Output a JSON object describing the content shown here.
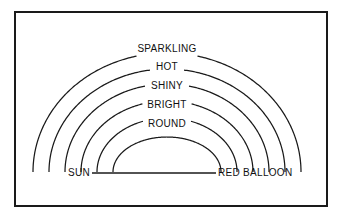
{
  "figure": {
    "kind": "semantic-arc-diagram",
    "width": 341,
    "height": 222,
    "background_color": "#ffffff",
    "ink_color": "#1a1a1a"
  },
  "frame": {
    "name": "figure-border",
    "x": 15,
    "y": 12,
    "width": 312,
    "height": 194,
    "stroke_color": "#1a1a1a",
    "stroke_width": 2
  },
  "nodes": {
    "left": {
      "label": "SUN",
      "x": 90,
      "y": 176
    },
    "right": {
      "label": "RED BALLOON",
      "x": 218,
      "y": 176
    }
  },
  "baseline": {
    "name": "sun-to-red-balloon-connector",
    "x1": 92,
    "x2": 216,
    "y": 173
  },
  "arcs": [
    {
      "label": "SPARKLING",
      "index": 0,
      "rx": 134,
      "ry": 119,
      "cx": 167,
      "cy": 172,
      "label_x": 167,
      "label_y": 52,
      "gap_half_width": 33
    },
    {
      "label": "HOT",
      "index": 1,
      "rx": 118,
      "ry": 103,
      "cx": 167,
      "cy": 172,
      "label_x": 167,
      "label_y": 70,
      "gap_half_width": 16
    },
    {
      "label": "SHINY",
      "index": 2,
      "rx": 102,
      "ry": 88,
      "cx": 167,
      "cy": 172,
      "label_x": 167,
      "label_y": 89,
      "gap_half_width": 21
    },
    {
      "label": "BRIGHT",
      "index": 3,
      "rx": 86,
      "ry": 71,
      "cx": 167,
      "cy": 172,
      "label_x": 167,
      "label_y": 108,
      "gap_half_width": 24
    },
    {
      "label": "ROUND",
      "index": 4,
      "rx": 70,
      "ry": 54,
      "cx": 167,
      "cy": 172,
      "label_x": 167,
      "label_y": 127,
      "gap_half_width": 24
    },
    {
      "label": "",
      "index": 5,
      "rx": 54,
      "ry": 35,
      "cx": 167,
      "cy": 172,
      "label_x": 167,
      "label_y": 0,
      "gap_half_width": 0
    }
  ],
  "chart_data": {
    "type": "diagram",
    "title": "",
    "concept_left": "SUN",
    "concept_right": "RED BALLOON",
    "shared_attributes": [
      "SPARKLING",
      "HOT",
      "SHINY",
      "BRIGHT",
      "ROUND"
    ],
    "arc_count": 6,
    "labeled_arc_count": 5,
    "note": "Nested semicircular arcs linking two concepts, each arc annotated with a shared attribute at its apex"
  }
}
